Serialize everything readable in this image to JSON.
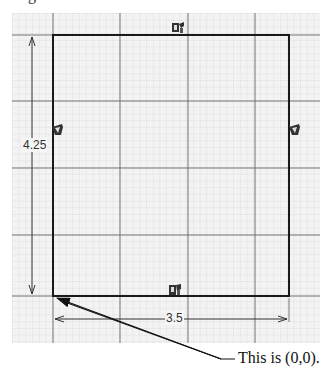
{
  "caption_fragment": "g",
  "sketch": {
    "grid": {
      "area": {
        "x": 12,
        "y": 13,
        "width": 308,
        "height": 330
      },
      "minor_spacing": 6.7,
      "major_spacing": 67,
      "minor_color": "#b8b8b8",
      "major_color": "#555555",
      "background": "#f3f3f3"
    },
    "rectangle": {
      "x": 53,
      "y": 35,
      "width": 236,
      "height": 261,
      "stroke": "#1a1a1a"
    },
    "dimensions": {
      "height": {
        "value": "4.25",
        "label_x": 28,
        "label_y": 138
      },
      "width": {
        "value": "3.5",
        "label_x": 165,
        "label_y": 311
      }
    },
    "constraints": [
      {
        "name": "horizontal-constraint-top",
        "type": "horizontal",
        "x": 172,
        "y": 22
      },
      {
        "name": "vertical-constraint-left",
        "type": "vertical",
        "x": 52,
        "y": 124
      },
      {
        "name": "vertical-constraint-right",
        "type": "vertical",
        "x": 289,
        "y": 124
      },
      {
        "name": "horizontal-constraint-bottom",
        "type": "horizontal",
        "x": 169,
        "y": 284
      }
    ],
    "origin": {
      "x": 53,
      "y": 296
    }
  },
  "annotation": {
    "text": "This is (0,0).",
    "leader": {
      "from_x": 235,
      "from_y": 359,
      "knee_x": 221,
      "to_x": 57,
      "to_y": 298
    }
  }
}
